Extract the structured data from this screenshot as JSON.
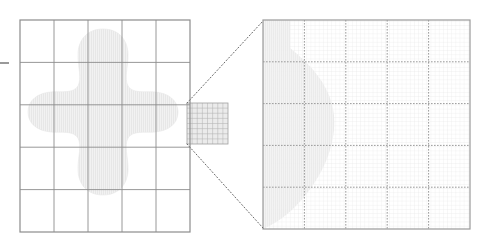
{
  "figure": {
    "background_color": "#ffffff",
    "grid_line_color": "#8c8c8c",
    "fine_grid_color": "#c8c8c8",
    "dashed_grid_color": "#9a9a9a",
    "region_fill_color": "#e6e6e6",
    "region_stroke_color": "#dcdcdc",
    "connector_color": "#707070",
    "panel_border_color": "#9a9a9a",
    "refined_cell_fill_color": "#ebebeb"
  },
  "left_panel": {
    "name": "coarse-mesh-panel",
    "x": 20,
    "y": 20,
    "width": 170,
    "height": 212,
    "columns": 5,
    "rows": 5,
    "column_edges": [
      20,
      54,
      88,
      122,
      156,
      190
    ],
    "row_edges": [
      20,
      62.4,
      104.8,
      147.2,
      189.6,
      232
    ],
    "border_color": "#8c8c8c",
    "axis_tick": {
      "name": "left-axis-tick",
      "x1": 0,
      "y1": 63,
      "x2": 9,
      "y2": 63,
      "color": "#6e6e6e",
      "label": ""
    },
    "region": {
      "name": "shaded-region",
      "description": "four-lobed star shaped refinement region",
      "fill": "#e7e7e7",
      "path": "M 103 29 C 119 29 128 40 128 55 C 128 68 124 78 128 86 C 133 94 145 91 155 92 C 168 93 178 100 178 112 C 178 124 168 131 155 132 C 145 133 133 130 128 138 C 124 146 128 156 128 169 C 128 184 119 195 103 195 C 87 195 78 184 78 169 C 78 156 82 146 78 138 C 73 130 61 133 51 132 C 38 131 28 124 28 112 C 28 100 38 93 51 92 C 61 91 73 94 78 86 C 82 78 78 68 78 55 C 78 40 87 29 103 29 Z"
    },
    "refined_cell": {
      "name": "refined-cell",
      "x": 187,
      "y": 103,
      "width": 41,
      "height": 41,
      "subdivisions": 8,
      "fill": "#ebebeb",
      "line_color": "#b4b4b4"
    }
  },
  "right_panel": {
    "name": "refined-mesh-panel",
    "x": 263,
    "y": 20,
    "width": 207,
    "height": 209,
    "columns": 5,
    "rows": 5,
    "column_edges": [
      263,
      304.4,
      345.8,
      387.2,
      428.6,
      470
    ],
    "row_edges": [
      20,
      61.8,
      103.6,
      145.4,
      187.2,
      229
    ],
    "border_color": "#9a9a9a",
    "dashed_line_color": "#8f8f8f",
    "fine_subdivisions_per_cell": 10,
    "fine_line_color": "#dedede",
    "region": {
      "name": "shaded-region-magnified",
      "description": "magnified boundary arc of the refinement region",
      "fill": "#e9e9e9",
      "path": "M 263 229 C 280 222 296 208 308 192 C 322 174 332 152 334 130 C 336 110 330 92 318 76 C 310 65 300 56 290 48 L 290 20 L 263 20 Z"
    }
  },
  "connectors": [
    {
      "name": "zoom-connector-top",
      "x1": 187,
      "y1": 103,
      "x2": 263,
      "y2": 21,
      "style": "dotted",
      "color": "#6a6a6a"
    },
    {
      "name": "zoom-connector-bottom",
      "x1": 187,
      "y1": 144,
      "x2": 263,
      "y2": 228,
      "style": "dotted",
      "color": "#6a6a6a"
    }
  ]
}
